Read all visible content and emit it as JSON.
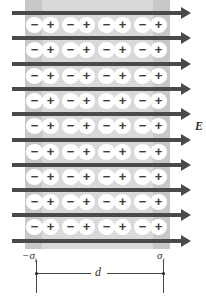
{
  "figure": {
    "field_label": "E",
    "left_surface_charge_label": "−σ",
    "left_surface_charge_sub": "i",
    "right_surface_charge_label": "σ",
    "right_surface_charge_sub": "i",
    "thickness_label": "d",
    "dipole_negative_sign": "−",
    "dipole_positive_sign": "+",
    "arrow_count": 10,
    "dipole_rows": 9,
    "dipole_columns": 4,
    "colors": {
      "slab": "#d9d9d9",
      "plate_strip": "#c8c8c8",
      "arrow": "#4a4a4a",
      "dipole_bg": "#ffffff",
      "sign": "#3c3c3c"
    }
  }
}
